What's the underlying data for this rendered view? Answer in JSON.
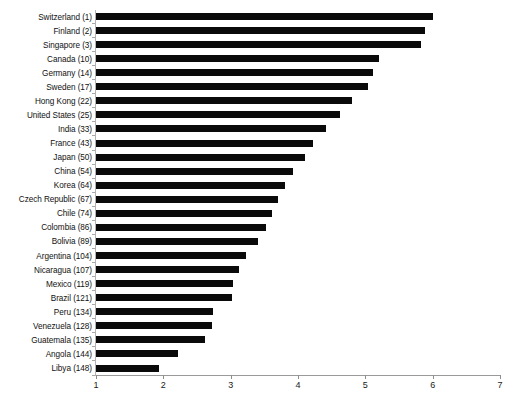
{
  "chart_data": {
    "type": "bar",
    "orientation": "horizontal",
    "title": "",
    "subtitle": "",
    "xlabel": "",
    "ylabel": "",
    "xlim": [
      1,
      7
    ],
    "ylim": null,
    "grid": false,
    "legend": null,
    "bar_color": "#0a0a0a",
    "background_color": "#ffffff",
    "axis_color": "#9a9a9a",
    "xticks": [
      1,
      2,
      3,
      4,
      5,
      6,
      7
    ],
    "xtick_labels": [
      "1",
      "2",
      "3",
      "4",
      "5",
      "6",
      "7"
    ],
    "categories": [
      "Switzerland (1)",
      "Finland (2)",
      "Singapore (3)",
      "Canada (10)",
      "Germany (14)",
      "Sweden (17)",
      "Hong Kong (22)",
      "United States (25)",
      "India (33)",
      "France (43)",
      "Japan (50)",
      "China (54)",
      "Korea (64)",
      "Czech Republic (67)",
      "Chile (74)",
      "Colombia (86)",
      "Bolivia (89)",
      "Argentina (104)",
      "Nicaragua (107)",
      "Mexico (119)",
      "Brazil (121)",
      "Peru (134)",
      "Venezuela (128)",
      "Guatemala (135)",
      "Angola (144)",
      "Libya (148)"
    ],
    "values": [
      6.0,
      5.89,
      5.82,
      5.2,
      5.11,
      5.04,
      4.8,
      4.62,
      4.42,
      4.22,
      4.1,
      3.92,
      3.8,
      3.71,
      3.62,
      3.52,
      3.41,
      3.23,
      3.13,
      3.03,
      3.02,
      2.74,
      2.73,
      2.62,
      2.22,
      1.94
    ]
  }
}
